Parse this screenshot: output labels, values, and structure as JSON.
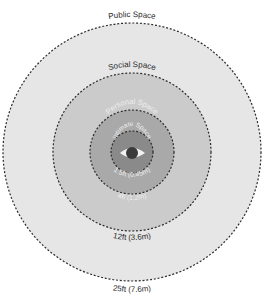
{
  "diagram": {
    "center": {
      "x": 132,
      "y": 152
    },
    "zones": [
      {
        "name": "Public Space",
        "radius": 129,
        "fill": "#e6e6e6",
        "distance": "25ft (7.6m)"
      },
      {
        "name": "Social Space",
        "radius": 79,
        "fill": "#cbcbcb",
        "distance": "12ft (3.6m)"
      },
      {
        "name": "Personal Space",
        "radius": 42,
        "fill": "#a9a9a9",
        "distance": "4ft (1.2m)"
      },
      {
        "name": "Intimate Space",
        "radius": 21,
        "fill": "#8a8a8a",
        "distance": "1.5ft (0.45m)"
      }
    ],
    "center_icon": "eye-icon",
    "colors": {
      "stroke": "#2b2b2b",
      "eye_white": "#f2f2f2",
      "pupil": "#3a3a3a"
    }
  }
}
